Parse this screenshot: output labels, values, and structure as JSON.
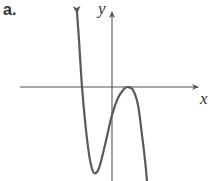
{
  "figure": {
    "panel_label": "a.",
    "x_axis_label": "x",
    "y_axis_label": "y",
    "colors": {
      "axis": "#555555",
      "curve": "#5a5a5a",
      "text": "#333333"
    }
  },
  "chart_data": {
    "type": "line",
    "title": "a.",
    "xlabel": "x",
    "ylabel": "y",
    "grid": false,
    "legend": null,
    "features": {
      "left_end_behavior": "up (arrow)",
      "right_end_behavior": "down",
      "x_intercepts": [
        "negative root (crosses)",
        "positive root (touches, local max)"
      ],
      "y_intercept": "negative",
      "local_min": "below x-axis, left of y-axis",
      "local_max": "on x-axis, right of y-axis"
    },
    "pixel_points": [
      [
        77,
        12
      ],
      [
        79,
        40
      ],
      [
        82,
        87
      ],
      [
        86,
        130
      ],
      [
        90,
        160
      ],
      [
        94,
        173
      ],
      [
        99,
        168
      ],
      [
        105,
        145
      ],
      [
        112,
        115
      ],
      [
        118,
        98
      ],
      [
        124,
        89
      ],
      [
        128,
        87
      ],
      [
        133,
        90
      ],
      [
        138,
        105
      ],
      [
        142,
        135
      ],
      [
        145,
        160
      ],
      [
        147,
        181
      ]
    ]
  }
}
